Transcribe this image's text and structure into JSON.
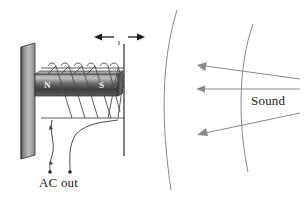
{
  "figure": {
    "background_color": "#ffffff",
    "width": 306,
    "height": 200
  },
  "labels": {
    "ac_out": "AC out",
    "sound": "Sound",
    "north_pole": "N",
    "south_pole": "S"
  },
  "colors": {
    "stroke": "#3a3a3a",
    "wire": "#4a4a4a",
    "magnet_dark": "#3d3d3d",
    "magnet_mid": "#8c8c8c",
    "magnet_light": "#b9b9b9",
    "diaphragm_dark": "#4f4f4f",
    "diaphragm_light": "#cfcfcf",
    "wavefront": "#7d7d7d",
    "arrow": "#1a1a1a",
    "text": "#1a1a1a",
    "pole_text": "#f2f2f2"
  },
  "components": {
    "diaphragm": {
      "name": "diaphragm-plate",
      "description": "tilted rectangular membrane at left"
    },
    "magnet": {
      "name": "permanent-magnet",
      "poles": [
        "N",
        "S"
      ],
      "description": "horizontal bar magnet with north pole at left and south pole at right"
    },
    "coil": {
      "name": "voice-coil",
      "turns": 6,
      "description": "helical wire winding around the magnet"
    },
    "frame": {
      "name": "support-frame",
      "description": "vertical support line right of the coil"
    },
    "leads": {
      "name": "output-leads",
      "count": 2,
      "description": "two curved wires descending to terminal dots"
    },
    "vibration_arrow": {
      "name": "vibration-arrow",
      "direction": "bidirectional-horizontal",
      "description": "double headed arrow indicating diaphragm motion"
    },
    "sound_waves": {
      "name": "sound-wavefronts",
      "count": 2,
      "description": "two curved arcs representing incoming sound wavefronts"
    },
    "sound_arrows": {
      "name": "sound-direction-arrows",
      "count": 3,
      "direction": "leftward",
      "description": "three arrows pointing left toward the diaphragm"
    }
  }
}
